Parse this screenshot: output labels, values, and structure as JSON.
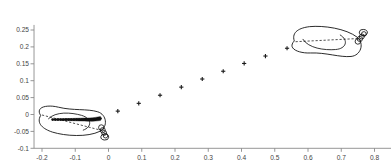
{
  "chart_data": {
    "type": "scatter",
    "title": "",
    "subtitle": "",
    "xlabel": "",
    "ylabel": "",
    "xlim": [
      -0.23,
      0.8
    ],
    "ylim": [
      -0.1,
      0.265
    ],
    "grid": false,
    "legend": "none",
    "xticks": [
      -0.2,
      -0.1,
      0,
      0.1,
      0.2,
      0.3,
      0.4,
      0.5,
      0.6,
      0.7,
      0.8
    ],
    "xticklabels": [
      "-0.2",
      "-0.1",
      "0",
      "0.1",
      "0.2",
      "0.3",
      "0.4",
      "0.5",
      "0.6",
      "0.7",
      "0.8"
    ],
    "yticks": [
      -0.1,
      -0.05,
      0,
      0.05,
      0.1,
      0.15,
      0.2,
      0.25
    ],
    "yticklabels": [
      "-0.1",
      "-0.05",
      "0",
      "0.05",
      "0.1",
      "0.15",
      "0.2",
      "0.25"
    ],
    "series": [
      {
        "name": "centre-of-pressure-trajectory",
        "marker": "plus",
        "color": "#1a1a1a",
        "x": [
          0.028,
          0.091,
          0.155,
          0.219,
          0.282,
          0.345,
          0.408,
          0.472,
          0.537
        ],
        "y": [
          0.01,
          0.033,
          0.057,
          0.081,
          0.105,
          0.128,
          0.151,
          0.173,
          0.196
        ]
      },
      {
        "name": "left-foot-stance-track",
        "marker": "filled-arrow-track",
        "color": "#111111",
        "x": [
          -0.168,
          -0.16,
          -0.152,
          -0.144,
          -0.136,
          -0.128,
          -0.12,
          -0.112,
          -0.104,
          -0.096,
          -0.088,
          -0.08,
          -0.072,
          -0.064,
          -0.056,
          -0.048,
          -0.04,
          -0.032,
          -0.024
        ],
        "y": [
          -0.015,
          -0.015,
          -0.015,
          -0.015,
          -0.015,
          -0.015,
          -0.015,
          -0.015,
          -0.015,
          -0.015,
          -0.015,
          -0.015,
          -0.015,
          -0.015,
          -0.015,
          -0.015,
          -0.014,
          -0.013,
          -0.012
        ]
      }
    ],
    "shapes": [
      {
        "name": "left-foot-outline",
        "kind": "foot",
        "side": "left",
        "heel_xy": [
          -0.205,
          -0.013
        ],
        "toe_xy": [
          -0.008,
          -0.03
        ],
        "line": "solid",
        "color": "#111111",
        "toe_count": 5,
        "has_dashed_axis": true
      },
      {
        "name": "right-foot-outline",
        "kind": "foot",
        "side": "right",
        "heel_xy": [
          0.56,
          0.228
        ],
        "toe_xy": [
          0.762,
          0.205
        ],
        "line": "solid",
        "color": "#111111",
        "toe_count": 5,
        "has_dashed_axis": true
      }
    ],
    "axis_color": "#8a8a8a",
    "marker_color": "#1a1a1a",
    "outline_color": "#111111"
  }
}
